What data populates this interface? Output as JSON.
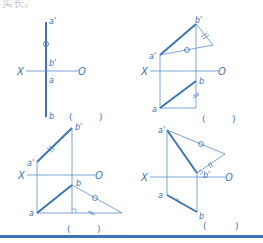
{
  "header": {
    "text": "实长。"
  },
  "colors": {
    "line": "#3d74b8",
    "thin": "#5a8ed0",
    "rule": "#3b72bb"
  },
  "figures": [
    {
      "id": "fig1",
      "labels": {
        "a_prime": "a'",
        "b_prime": "b'",
        "a": "a",
        "b": "b",
        "x": "X",
        "o": "O"
      },
      "answer": {
        "open": "(",
        "close": ")"
      }
    },
    {
      "id": "fig2",
      "labels": {
        "a_prime": "a'",
        "b_prime": "b'",
        "a": "a",
        "b": "b",
        "x": "X",
        "o": "O"
      },
      "answer": {
        "open": "(",
        "close": ")"
      }
    },
    {
      "id": "fig3",
      "labels": {
        "a_prime": "a'",
        "b_prime": "b'",
        "a": "a",
        "b": "b",
        "x": "X",
        "o": "O"
      },
      "answer": {
        "open": "(",
        "close": ")"
      }
    },
    {
      "id": "fig4",
      "labels": {
        "a_prime": "a'",
        "b_prime": "b'",
        "a": "a",
        "b": "b",
        "x": "X",
        "o": "O"
      },
      "answer": {
        "open": "(",
        "close": ")"
      }
    }
  ]
}
